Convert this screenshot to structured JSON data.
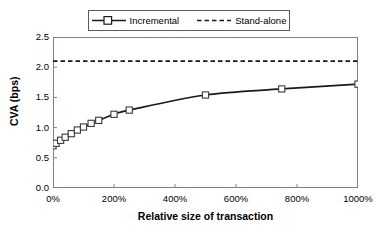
{
  "chart_data": {
    "type": "line",
    "title": "",
    "xlabel": "Relative size of transaction",
    "ylabel": "CVA (bps)",
    "xlim": [
      0,
      1000
    ],
    "ylim": [
      0,
      2.5
    ],
    "grid": false,
    "legend_position": "top-center",
    "x_tick_labels": [
      "0%",
      "200%",
      "400%",
      "600%",
      "800%",
      "1000%"
    ],
    "x_tick_values": [
      0,
      200,
      400,
      600,
      800,
      1000
    ],
    "y_tick_labels": [
      "0.0",
      "0.5",
      "1.0",
      "1.5",
      "2.0",
      "2.5"
    ],
    "y_tick_values": [
      0.0,
      0.5,
      1.0,
      1.5,
      2.0,
      2.5
    ],
    "series": [
      {
        "name": "Incremental",
        "style": "solid-line-with-square-markers",
        "color": "#1a1a1a",
        "x": [
          0,
          10,
          25,
          40,
          60,
          80,
          100,
          125,
          150,
          200,
          250,
          500,
          750,
          1000
        ],
        "y": [
          0.7,
          0.74,
          0.79,
          0.84,
          0.9,
          0.96,
          1.01,
          1.07,
          1.12,
          1.22,
          1.29,
          1.54,
          1.64,
          1.72
        ]
      },
      {
        "name": "Stand-alone",
        "style": "dashed-horizontal-line",
        "color": "#1a1a1a",
        "constant_value": 2.1
      }
    ]
  },
  "legend": {
    "items": [
      {
        "label": "Incremental",
        "marker": "square-marker-icon"
      },
      {
        "label": "Stand-alone",
        "marker": "dashed-line-icon"
      }
    ]
  }
}
